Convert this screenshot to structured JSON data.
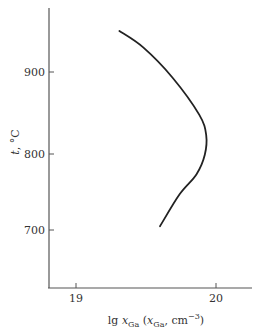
{
  "chart_data": {
    "type": "line",
    "title": "",
    "xlabel": "lg x_Ga (x_Ga, cm^-3)",
    "ylabel": "t, °C",
    "xlim": [
      18.8,
      20.25
    ],
    "ylim": [
      630,
      980
    ],
    "x_ticks": [
      19,
      20
    ],
    "y_ticks": [
      700,
      800,
      900
    ],
    "grid": false,
    "legend": null,
    "series": [
      {
        "name": "solubility curve",
        "points": [
          {
            "x": 19.31,
            "y": 950
          },
          {
            "x": 19.48,
            "y": 930
          },
          {
            "x": 19.69,
            "y": 893
          },
          {
            "x": 19.88,
            "y": 848
          },
          {
            "x": 19.93,
            "y": 823
          },
          {
            "x": 19.92,
            "y": 799
          },
          {
            "x": 19.86,
            "y": 773
          },
          {
            "x": 19.74,
            "y": 747
          },
          {
            "x": 19.6,
            "y": 705
          }
        ]
      }
    ],
    "color": "#222222"
  },
  "labels": {
    "y_axis_var": "t",
    "y_axis_unit": ", °C",
    "x_axis_prefix": "lg ",
    "x_axis_var": "x",
    "x_axis_sub": "Ga",
    "x_axis_paren_open": " (",
    "x_axis_var2": "x",
    "x_axis_sub2": "Ga",
    "x_axis_unit": ", cm",
    "x_axis_exp": "−3",
    "x_axis_paren_close": ")",
    "tick_900": "900",
    "tick_800": "800",
    "tick_700": "700",
    "tick_19": "19",
    "tick_20": "20"
  }
}
